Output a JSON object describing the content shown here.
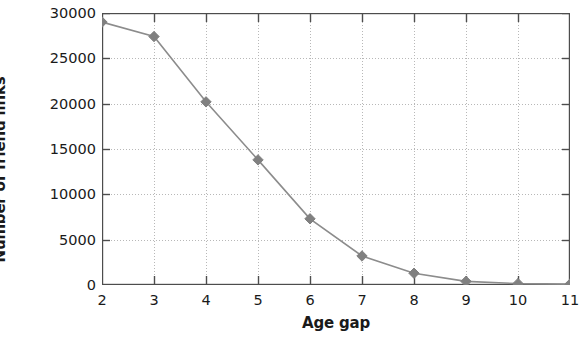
{
  "chart_data": {
    "type": "line",
    "title": "",
    "xlabel": "Age gap",
    "ylabel": "Number of friend links",
    "x": [
      2,
      3,
      4,
      5,
      6,
      7,
      8,
      9,
      10,
      11
    ],
    "values": [
      29000,
      27400,
      20200,
      13800,
      7300,
      3200,
      1300,
      400,
      150,
      100
    ],
    "series": [
      {
        "name": "Number of friend links",
        "values": [
          29000,
          27400,
          20200,
          13800,
          7300,
          3200,
          1300,
          400,
          150,
          100
        ]
      }
    ],
    "xlim": [
      2,
      11
    ],
    "ylim": [
      0,
      30000
    ],
    "xticks": [
      2,
      3,
      4,
      5,
      6,
      7,
      8,
      9,
      10,
      11
    ],
    "xtick_labels": [
      "2",
      "3",
      "4",
      "5",
      "6",
      "7",
      "8",
      "9",
      "10",
      "11"
    ],
    "yticks": [
      0,
      5000,
      10000,
      15000,
      20000,
      25000,
      30000
    ],
    "ytick_labels": [
      "0",
      "5000",
      "10000",
      "15000",
      "20000",
      "25000",
      "30000"
    ],
    "grid": true,
    "grid_style": "dotted",
    "legend": false,
    "legend_position": "none",
    "marker": "diamond",
    "colors": {
      "marker": "#808080",
      "line": "#8c8c8c",
      "grid": "#b8b8b8",
      "axis": "#4d4d4d",
      "text": "#1a1a1a",
      "background": "#ffffff"
    }
  }
}
